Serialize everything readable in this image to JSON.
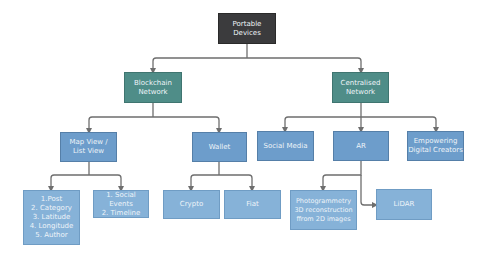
{
  "diagram": {
    "type": "hierarchy",
    "colors": {
      "root": "#3b3b3d",
      "level1": "#4f8d88",
      "level2": "#6d9dcb",
      "level3": "#86b2d8",
      "connector": "#6e6e6e",
      "text": "#eef4f8"
    },
    "nodes": {
      "root": {
        "label": "Portable\nDevices"
      },
      "blockchain": {
        "label": "Blockchain\nNetwork",
        "parent": "root"
      },
      "centralised": {
        "label": "Centralised\nNetwork",
        "parent": "root"
      },
      "mapview": {
        "label": "Map View /\nList View",
        "parent": "blockchain"
      },
      "wallet": {
        "label": "Wallet",
        "parent": "blockchain"
      },
      "socialmedia": {
        "label": "Social Media",
        "parent": "centralised"
      },
      "ar": {
        "label": "AR",
        "parent": "centralised"
      },
      "empowering": {
        "label": "Empowering\nDigital Creators",
        "parent": "centralised"
      },
      "postlist": {
        "label": "1.Post\n2. Category\n3. Latitude\n4. Longitude\n5. Author",
        "parent": "mapview"
      },
      "socialevents": {
        "label": "1. Social Events\n2. Timeline",
        "parent": "mapview"
      },
      "crypto": {
        "label": "Crypto",
        "parent": "wallet"
      },
      "fiat": {
        "label": "Fiat",
        "parent": "wallet"
      },
      "photogrammetry": {
        "label": "Photogrammetry\n3D reconstruction\nffrom 2D images",
        "parent": "ar"
      },
      "lidar": {
        "label": "LiDAR",
        "parent": "ar"
      }
    }
  }
}
